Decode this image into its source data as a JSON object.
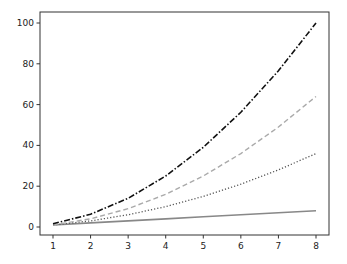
{
  "chart_data": {
    "type": "line",
    "title": "",
    "xlabel": "",
    "ylabel": "",
    "xlim": [
      0.8,
      8.35
    ],
    "ylim": [
      -4.5,
      105
    ],
    "grid": false,
    "legend": null,
    "x": [
      1,
      2,
      3,
      4,
      5,
      6,
      7,
      8
    ],
    "x_ticks": [
      "1",
      "2",
      "3",
      "4",
      "5",
      "6",
      "7",
      "8"
    ],
    "y_ticks": [
      "0",
      "20",
      "40",
      "60",
      "80",
      "100"
    ],
    "series": [
      {
        "name": "solid",
        "style": "solid",
        "color": "#888888",
        "values": [
          1,
          2,
          3,
          4,
          5,
          6,
          7,
          8
        ]
      },
      {
        "name": "dotted",
        "style": "dotted",
        "color": "#555555",
        "values": [
          1,
          3,
          6,
          10,
          15,
          21,
          28,
          36
        ]
      },
      {
        "name": "dashed",
        "style": "dashed",
        "color": "#aaaaaa",
        "values": [
          1,
          4,
          9,
          16,
          25,
          36,
          49,
          64
        ]
      },
      {
        "name": "dashdot",
        "style": "dashdot",
        "color": "#111111",
        "values": [
          1.56,
          6.25,
          14.06,
          25,
          39.06,
          56.25,
          76.56,
          100
        ]
      }
    ]
  }
}
